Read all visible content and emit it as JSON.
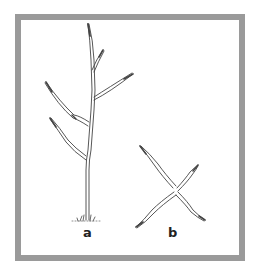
{
  "figure": {
    "frame_color": "#9a9a9a",
    "stroke_color": "#444444",
    "panels": [
      {
        "id": "a",
        "label": "a",
        "description": "upright plant stem with alternating branches"
      },
      {
        "id": "b",
        "label": "b",
        "description": "cross-shaped spreading branches"
      }
    ]
  }
}
